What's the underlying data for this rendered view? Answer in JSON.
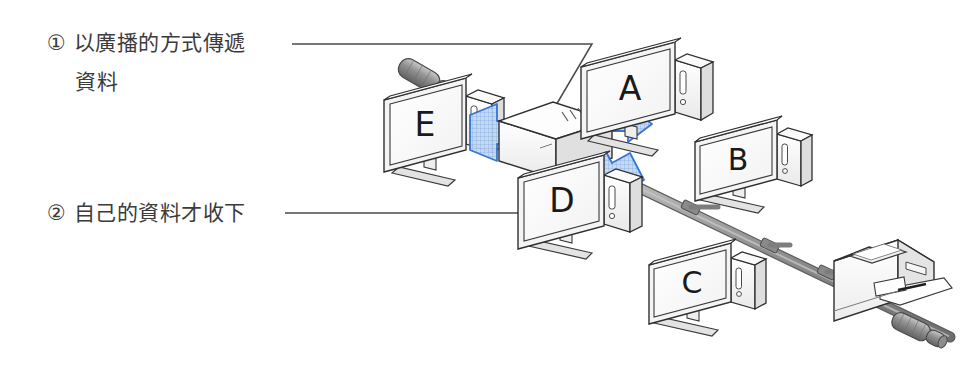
{
  "figure": {
    "kind": "network-topology-illustration",
    "background_color": "#ffffff",
    "line_color": "#333333",
    "cable_color": "#9a9a9a",
    "accent_color": "#2f6fd0",
    "arrow_fill": "#bcd4f0"
  },
  "annotations": [
    {
      "id": "note-1",
      "marker": "①",
      "line1": "① 以廣播的方式傳遞",
      "line2": "資料",
      "points_to": "hub"
    },
    {
      "id": "note-2",
      "marker": "②",
      "line1": "② 自己的資料才收下",
      "line2": "",
      "points_to": "computer-d"
    }
  ],
  "nodes": [
    {
      "id": "computer-a",
      "label": "A",
      "type": "desktop-computer"
    },
    {
      "id": "computer-b",
      "label": "B",
      "type": "desktop-computer"
    },
    {
      "id": "computer-c",
      "label": "C",
      "type": "desktop-computer"
    },
    {
      "id": "computer-d",
      "label": "D",
      "type": "desktop-computer"
    },
    {
      "id": "computer-e",
      "label": "E",
      "type": "desktop-computer"
    },
    {
      "id": "hub",
      "label": "",
      "type": "network-hub"
    },
    {
      "id": "printer",
      "label": "",
      "type": "laser-printer"
    },
    {
      "id": "terminator-left",
      "label": "",
      "type": "cable-terminator"
    },
    {
      "id": "terminator-right",
      "label": "",
      "type": "cable-terminator"
    }
  ],
  "broadcast_arrows": [
    {
      "id": "arrow-to-e",
      "from": "hub",
      "to": "computer-e",
      "direction": "left"
    },
    {
      "id": "arrow-to-a",
      "from": "hub",
      "to": "computer-a",
      "direction": "right"
    },
    {
      "id": "arrow-to-d",
      "from": "hub",
      "to": "computer-d",
      "direction": "down-right"
    }
  ],
  "bus_segments": [
    {
      "id": "bus-main",
      "from": "computer-d",
      "to": "terminator-right"
    }
  ]
}
